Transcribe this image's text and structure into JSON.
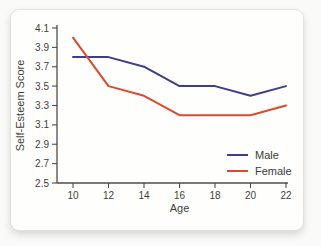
{
  "chart_data": {
    "type": "line",
    "title": "",
    "xlabel": "Age",
    "ylabel": "Self-Esteem Score",
    "x": [
      10,
      12,
      14,
      16,
      18,
      20,
      22
    ],
    "x_tick_labels": [
      "10",
      "12",
      "14",
      "16",
      "18",
      "20",
      "22"
    ],
    "y_ticks": [
      2.5,
      2.7,
      2.9,
      3.1,
      3.3,
      3.5,
      3.7,
      3.9,
      4.1
    ],
    "y_tick_labels": [
      "2.5",
      "2.7",
      "2.9",
      "3.1",
      "3.3",
      "3.5",
      "3.7",
      "3.9",
      "4.1"
    ],
    "xlim": [
      10,
      22
    ],
    "ylim": [
      2.5,
      4.1
    ],
    "grid": false,
    "legend_position": "lower right",
    "axis_color": "#4c4c4c",
    "series": [
      {
        "name": "Male",
        "color": "#3d3f8e",
        "values": [
          3.8,
          3.8,
          3.7,
          3.5,
          3.5,
          3.4,
          3.5
        ]
      },
      {
        "name": "Female",
        "color": "#dc4a2e",
        "values": [
          4.0,
          3.5,
          3.4,
          3.2,
          3.2,
          3.2,
          3.3
        ]
      }
    ]
  }
}
